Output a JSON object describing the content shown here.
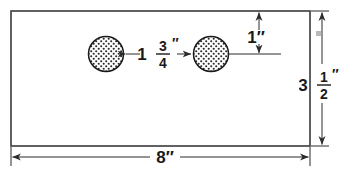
{
  "drawing": {
    "title": "Rectangular sheet with two holes",
    "shape": "rectangle",
    "colors": {
      "outline": "#3a3a3a",
      "dimension": "#2b2b2b",
      "text": "#1a1a1a",
      "background": "#ffffff",
      "hatch": "#2b2b2b"
    },
    "dimensions": {
      "width": {
        "label": "8",
        "unit": "″",
        "full": "8″",
        "position": "bottom"
      },
      "height": {
        "whole": "3",
        "numerator": "1",
        "denominator": "2",
        "unit": "″",
        "full": "3 1/2″",
        "position": "right"
      },
      "hole_spacing": {
        "whole": "1",
        "numerator": "3",
        "denominator": "4",
        "unit": "″",
        "full": "1 3/4″",
        "position": "center"
      },
      "top_offset": {
        "label": "1",
        "unit": "″",
        "full": "1″",
        "position": "top-right"
      }
    },
    "holes": [
      {
        "name": "left-hole",
        "cx": 106,
        "cy": 54,
        "r": 17.5
      },
      {
        "name": "right-hole",
        "cx": 211,
        "cy": 54,
        "r": 17.5
      }
    ]
  }
}
